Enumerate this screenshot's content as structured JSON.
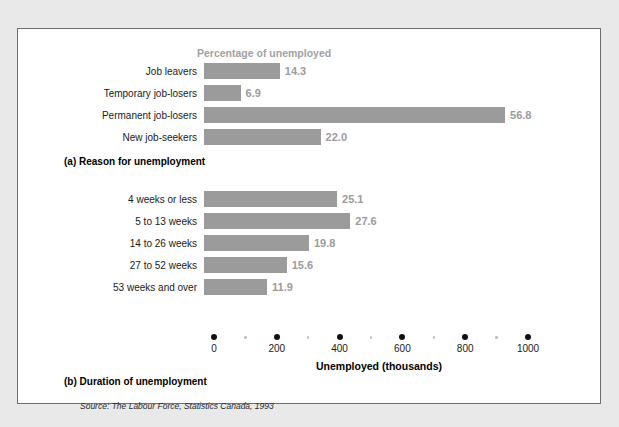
{
  "figure": {
    "source_note": "Source: The Labour Force, Statistics Canada, 1993",
    "caption_a": "(a) Reason for unemployment",
    "caption_b": "(b) Duration of unemployment",
    "percentage_header": "Percentage of unemployed",
    "axis_title": "Unemployed (thousands)",
    "bar_color": "#9b9b9b",
    "value_color": "#9b9b9b",
    "header_color": "#a2a2a2",
    "panel_bg": "#ffffff",
    "page_bg": "#e9e9e9"
  },
  "chart_data": [
    {
      "type": "bar",
      "orientation": "horizontal",
      "title": "(a) Reason for unemployment",
      "subtitle": "Percentage of unemployed",
      "xlabel": "Unemployed (thousands)",
      "ylabel": "",
      "grid": false,
      "legend": "none",
      "value_unit": "percent",
      "xlim": [
        0,
        1000
      ],
      "axis_scale_note": "bars drawn on shared 0-1000 thousands axis; labels show percentage of unemployed",
      "categories": [
        "Job leavers",
        "Temporary job-losers",
        "Permanent job-losers",
        "New job-seekers"
      ],
      "values": [
        14.3,
        6.9,
        56.8,
        22.0
      ],
      "value_labels": [
        "14.3",
        "6.9",
        "56.8",
        "22.0"
      ]
    },
    {
      "type": "bar",
      "orientation": "horizontal",
      "title": "(b) Duration of unemployment",
      "subtitle": "",
      "xlabel": "Unemployed (thousands)",
      "ylabel": "",
      "grid": false,
      "legend": "none",
      "value_unit": "percent",
      "xlim": [
        0,
        1000
      ],
      "xticks": [
        0,
        200,
        400,
        600,
        800,
        1000
      ],
      "xtick_labels": [
        "0",
        "200",
        "400",
        "600",
        "800",
        "1000"
      ],
      "minor_xticks": [
        100,
        300,
        500,
        700,
        900
      ],
      "categories": [
        "4 weeks or less",
        "5 to 13 weeks",
        "14 to 26 weeks",
        "27 to 52 weeks",
        "53 weeks and over"
      ],
      "values": [
        25.1,
        27.6,
        19.8,
        15.6,
        11.9
      ],
      "value_labels": [
        "25.1",
        "27.6",
        "19.8",
        "15.6",
        "11.9"
      ]
    }
  ],
  "chart_a": {
    "rows": [
      {
        "label": "Job leavers",
        "value": "14.3"
      },
      {
        "label": "Temporary job-losers",
        "value": "6.9"
      },
      {
        "label": "Permanent job-losers",
        "value": "56.8"
      },
      {
        "label": "New job-seekers",
        "value": "22.0"
      }
    ]
  },
  "chart_b": {
    "rows": [
      {
        "label": "4 weeks or less",
        "value": "25.1"
      },
      {
        "label": "5 to 13 weeks",
        "value": "27.6"
      },
      {
        "label": "14 to 26 weeks",
        "value": "19.8"
      },
      {
        "label": "27 to 52 weeks",
        "value": "15.6"
      },
      {
        "label": "53 weeks and over",
        "value": "11.9"
      }
    ]
  },
  "axis": {
    "ticks": [
      {
        "label": "0",
        "value": 0
      },
      {
        "label": "200",
        "value": 200
      },
      {
        "label": "400",
        "value": 400
      },
      {
        "label": "600",
        "value": 600
      },
      {
        "label": "800",
        "value": 800
      },
      {
        "label": "1000",
        "value": 1000
      }
    ],
    "minor": [
      100,
      300,
      500,
      700,
      900
    ]
  }
}
